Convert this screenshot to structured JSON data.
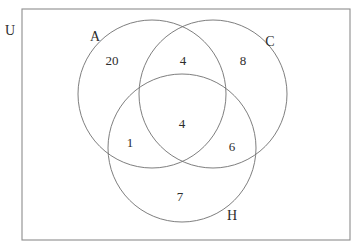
{
  "diagram": {
    "type": "venn-3-set",
    "title_visible": false,
    "background_color": "#ffffff",
    "stroke_color": "#6f6f6f",
    "rect_stroke_color": "#8d8d8d",
    "text_color": "#2c2c2c",
    "universe": {
      "label": "U",
      "label_x": 10,
      "label_y": 31,
      "rect": {
        "x": 22,
        "y": 9,
        "width": 328,
        "height": 231
      }
    },
    "sets": [
      {
        "id": "A",
        "label": "A",
        "cx": 152,
        "cy": 94,
        "r": 74,
        "label_x": 95,
        "label_y": 37
      },
      {
        "id": "C",
        "label": "C",
        "cx": 213,
        "cy": 94,
        "r": 74,
        "label_x": 270,
        "label_y": 42
      },
      {
        "id": "H",
        "label": "H",
        "cx": 182,
        "cy": 148,
        "r": 74,
        "label_x": 232,
        "label_y": 216
      }
    ],
    "regions": [
      {
        "id": "A-only",
        "region_sets": "A",
        "value": "20",
        "x": 112,
        "y": 60
      },
      {
        "id": "A-and-C",
        "region_sets": "A,C",
        "value": "4",
        "x": 183,
        "y": 60
      },
      {
        "id": "C-only",
        "region_sets": "C",
        "value": "8",
        "x": 243,
        "y": 60
      },
      {
        "id": "A-C-H",
        "region_sets": "A,C,H",
        "value": "4",
        "x": 182,
        "y": 123
      },
      {
        "id": "A-and-H",
        "region_sets": "A,H",
        "value": "1",
        "x": 130,
        "y": 142
      },
      {
        "id": "C-and-H",
        "region_sets": "C,H",
        "value": "6",
        "x": 232,
        "y": 146
      },
      {
        "id": "H-only",
        "region_sets": "H",
        "value": "7",
        "x": 180,
        "y": 196
      }
    ]
  }
}
